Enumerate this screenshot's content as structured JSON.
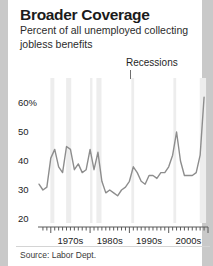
{
  "card": {
    "title": "Broader Coverage",
    "subtitle": "Percent of all unemployed collecting jobless benefits",
    "source": "Source: Labor Dept.",
    "recessions_label": "Recessions"
  },
  "colors": {
    "page_background": "#c9c9c9",
    "card_background": "#ffffff",
    "line": "#8d8d8d",
    "recession_band": "#ededed",
    "axis": "#5a5a5a",
    "text": "#1b1b1b"
  },
  "chart_data": {
    "type": "line",
    "title": "Broader Coverage",
    "subtitle": "Percent of all unemployed collecting jobless benefits",
    "xlabel": "",
    "ylabel": "Percent",
    "xlim": [
      1967,
      2010
    ],
    "ylim": [
      20,
      65
    ],
    "yticks": [
      20,
      30,
      40,
      50,
      60
    ],
    "ytick_labels": [
      "20",
      "30",
      "40",
      "50",
      "60%"
    ],
    "xticks": [
      1970,
      1980,
      1990,
      2000
    ],
    "xtick_labels": [
      "1970s",
      "1980s",
      "1990s",
      "2000s"
    ],
    "grid": false,
    "legend": "none",
    "annotations": [
      {
        "text": "Recessions",
        "x": 1991,
        "note": "points to shaded recession bands"
      }
    ],
    "recession_bands": [
      {
        "start": 1969.9,
        "end": 1970.9
      },
      {
        "start": 1973.9,
        "end": 1975.2
      },
      {
        "start": 1980.0,
        "end": 1980.6
      },
      {
        "start": 1981.6,
        "end": 1982.9
      },
      {
        "start": 1990.5,
        "end": 1991.2
      },
      {
        "start": 2001.2,
        "end": 2001.9
      },
      {
        "start": 2007.9,
        "end": 2009.5
      }
    ],
    "x": [
      1967,
      1968,
      1969,
      1970,
      1971,
      1972,
      1973,
      1974,
      1975,
      1976,
      1977,
      1978,
      1979,
      1980,
      1981,
      1982,
      1983,
      1984,
      1985,
      1986,
      1987,
      1988,
      1989,
      1990,
      1991,
      1992,
      1993,
      1994,
      1995,
      1996,
      1997,
      1998,
      1999,
      2000,
      2001,
      2002,
      2003,
      2004,
      2005,
      2006,
      2007,
      2008,
      2009
    ],
    "values": [
      32,
      30,
      31,
      41,
      44,
      38,
      36,
      45,
      44,
      37,
      39,
      36,
      37,
      44,
      37,
      43,
      33,
      29,
      30,
      29,
      28,
      30,
      31,
      33,
      38,
      36,
      33,
      32,
      35,
      35,
      34,
      36,
      36,
      38,
      42,
      50,
      40,
      35,
      35,
      35,
      36,
      42,
      62
    ],
    "series": [
      {
        "name": "Percent of unemployed collecting jobless benefits",
        "values": [
          32,
          30,
          31,
          41,
          44,
          38,
          36,
          45,
          44,
          37,
          39,
          36,
          37,
          44,
          37,
          43,
          33,
          29,
          30,
          29,
          28,
          30,
          31,
          33,
          38,
          36,
          33,
          32,
          35,
          35,
          34,
          36,
          36,
          38,
          42,
          50,
          40,
          35,
          35,
          35,
          36,
          42,
          62
        ]
      }
    ]
  }
}
